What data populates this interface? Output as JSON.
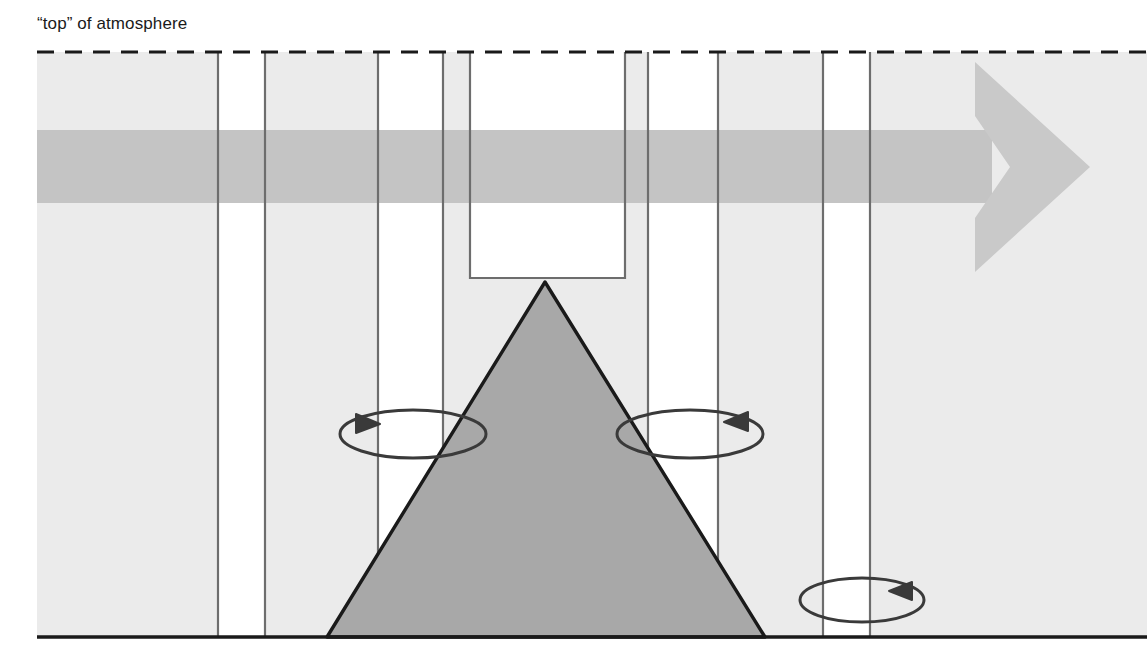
{
  "figure": {
    "kind": "atmospheric-column-diagram",
    "caption_label": "“top” of atmosphere",
    "background_color": "#ffffff",
    "atmosphere_fill": "#ebebeb",
    "column_gap_fill": "#ffffff",
    "mountain_fill": "#a8a8a8",
    "mountain_stroke": "#1a1a1a",
    "ground_stroke": "#1a1a1a",
    "column_stroke": "#6d6d6d",
    "dashed_stroke": "#1a1a1a",
    "wind_shaft_color": "#c4c4c4",
    "wind_head_color": "#c9c9c9",
    "ellipse_stroke": "#3a3a3a"
  },
  "elements": {
    "top_of_atmosphere_label": "“top” of atmosphere",
    "top_of_atmosphere_line": "dashed",
    "ground_line": "solid",
    "mountain": "shaded triangle",
    "wind_arrow": "horizontal right-pointing arrow",
    "rotation_arrows": [
      {
        "name": "left-rotation-ellipse",
        "direction": "arrowhead-right"
      },
      {
        "name": "center-rotation-ellipse",
        "direction": "arrowhead-left"
      },
      {
        "name": "ground-rotation-ellipse",
        "direction": "arrowhead-left"
      }
    ]
  },
  "geometry": {
    "frame": {
      "x": 37,
      "y": 52,
      "w": 1110,
      "h": 585
    },
    "top_dashed_y": 52,
    "ground_y": 637,
    "columns": [
      {
        "name": "column-a",
        "x0": 37,
        "x1": 218,
        "fill": "atmosphere"
      },
      {
        "name": "gap-a",
        "x0": 218,
        "x1": 265,
        "fill": "gap"
      },
      {
        "name": "column-b",
        "x0": 265,
        "x1": 378,
        "fill": "atmosphere"
      },
      {
        "name": "gap-b",
        "x0": 378,
        "x1": 443,
        "fill": "gap"
      },
      {
        "name": "column-c",
        "x0": 443,
        "x1": 470,
        "fill": "atmosphere"
      },
      {
        "name": "gap-notch",
        "x0": 470,
        "x1": 625,
        "fill": "gap",
        "bottom": 278
      },
      {
        "name": "column-d",
        "x0": 625,
        "x1": 648,
        "fill": "atmosphere"
      },
      {
        "name": "gap-c",
        "x0": 648,
        "x1": 718,
        "fill": "gap"
      },
      {
        "name": "column-e",
        "x0": 718,
        "x1": 823,
        "fill": "atmosphere"
      },
      {
        "name": "gap-d",
        "x0": 823,
        "x1": 870,
        "fill": "gap"
      },
      {
        "name": "column-f",
        "x0": 870,
        "x1": 1147,
        "fill": "atmosphere"
      }
    ],
    "mountain": {
      "peak_x": 545,
      "peak_y": 282,
      "left_x": 327,
      "right_x": 765,
      "base_y": 637
    },
    "wind_arrow": {
      "shaft_y0": 130,
      "shaft_y1": 203,
      "shaft_x0": 37,
      "head_x": 985,
      "head_tip_x": 1090,
      "head_y0": 62,
      "head_y1": 272
    },
    "ellipses": [
      {
        "cx": 413,
        "cy": 434,
        "rx": 73,
        "ry": 24
      },
      {
        "cx": 690,
        "cy": 434,
        "rx": 73,
        "ry": 24
      },
      {
        "cx": 862,
        "cy": 600,
        "rx": 62,
        "ry": 22
      }
    ]
  }
}
